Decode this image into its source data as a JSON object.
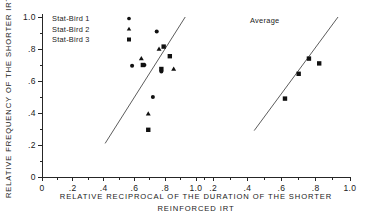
{
  "chart_data": {
    "type": "scatter",
    "title": "",
    "xlabel": "RELATIVE RECIPROCAL OF THE DURATION OF THE SHORTER REINFORCED IRT",
    "xlabel_line1": "RELATIVE RECIPROCAL OF THE DURATION OF THE SHORTER",
    "xlabel_line2": "REINFORCED IRT",
    "ylabel": "RELATIVE FREQUENCY OF THE SHORTER IRT",
    "grid": false,
    "legend_position": "top-left",
    "ylim": [
      0,
      1.0
    ],
    "ytick_labels": [
      "1.0",
      ".8",
      ".6",
      ".4",
      ".2",
      "0"
    ],
    "ytick_values": [
      1.0,
      0.8,
      0.6,
      0.4,
      0.2,
      0.0
    ],
    "panels": [
      {
        "name": "individual-birds",
        "annotation": "",
        "xlim": [
          0,
          1.0
        ],
        "xtick_labels": [
          "0",
          ".2",
          ".4",
          ".6",
          ".8",
          "1.0"
        ],
        "xtick_values": [
          0.0,
          0.2,
          0.4,
          0.6,
          0.8,
          1.0
        ],
        "fit_line": {
          "x1": 0.41,
          "y1": 0.21,
          "x2": 0.93,
          "y2": 1.0
        },
        "series": [
          {
            "name": "Stat-Bird 1",
            "marker": "circle",
            "points": [
              {
                "x": 0.585,
                "y": 0.695
              },
              {
                "x": 0.665,
                "y": 0.7
              },
              {
                "x": 0.745,
                "y": 0.91
              },
              {
                "x": 0.775,
                "y": 0.66
              },
              {
                "x": 0.72,
                "y": 0.5
              }
            ]
          },
          {
            "name": "Stat-Bird 2",
            "marker": "triangle",
            "points": [
              {
                "x": 0.645,
                "y": 0.74
              },
              {
                "x": 0.76,
                "y": 0.8
              },
              {
                "x": 0.855,
                "y": 0.675
              },
              {
                "x": 0.69,
                "y": 0.395
              }
            ]
          },
          {
            "name": "Stat-Bird 3",
            "marker": "square",
            "points": [
              {
                "x": 0.655,
                "y": 0.7
              },
              {
                "x": 0.79,
                "y": 0.815
              },
              {
                "x": 0.83,
                "y": 0.755
              },
              {
                "x": 0.775,
                "y": 0.675
              },
              {
                "x": 0.69,
                "y": 0.295
              }
            ]
          }
        ]
      },
      {
        "name": "average",
        "annotation": "Average",
        "xlim": [
          0.1,
          1.0
        ],
        "xtick_labels": [
          "1.0",
          ".2",
          ".4",
          ".6",
          ".8",
          "1.0"
        ],
        "xtick_values": [
          0.1,
          0.2,
          0.4,
          0.6,
          0.8,
          1.0
        ],
        "fit_line": {
          "x1": 0.44,
          "y1": 0.29,
          "x2": 0.93,
          "y2": 1.0
        },
        "series": [
          {
            "name": "Average",
            "marker": "square",
            "points": [
              {
                "x": 0.62,
                "y": 0.49
              },
              {
                "x": 0.7,
                "y": 0.645
              },
              {
                "x": 0.76,
                "y": 0.74
              },
              {
                "x": 0.82,
                "y": 0.71
              }
            ]
          }
        ]
      }
    ],
    "legend": [
      {
        "label": "Stat-Bird  1",
        "marker": "circle"
      },
      {
        "label": "Stat-Bird 2",
        "marker": "triangle"
      },
      {
        "label": "Stat-Bird 3",
        "marker": "square"
      }
    ]
  }
}
